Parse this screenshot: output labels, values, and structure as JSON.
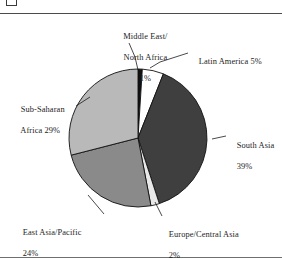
{
  "figure": {
    "corner_glyph": "page-corner-marker",
    "has_top_rule": true,
    "has_bottom_rule": true
  },
  "chart_data": {
    "type": "pie",
    "title": "",
    "subtitle": "",
    "xlabel": "",
    "ylabel": "",
    "legend_position": "callout-labels",
    "grid": false,
    "total": 100,
    "units": "percent",
    "start_angle_deg": -90,
    "direction": "clockwise",
    "categories": [
      "Middle East/\nNorth Africa",
      "Latin America",
      "South Asia",
      "Europe/Central Asia",
      "East Asia/Pacific",
      "Sub-Saharan Africa"
    ],
    "values": [
      1,
      5,
      39,
      2,
      24,
      29
    ],
    "slices": [
      {
        "key": "middle-east-north-africa",
        "name_line1": "Middle East/",
        "name_line2": "North Africa",
        "label": "Middle East/ North Africa",
        "value": 1,
        "value_label": "1%",
        "color": "#111111",
        "stroke": "#111111"
      },
      {
        "key": "latin-america",
        "name_line1": "Latin America 5%",
        "name_line2": "",
        "label": "Latin America",
        "value": 5,
        "value_label": "5%",
        "color": "#ffffff",
        "stroke": "#111111"
      },
      {
        "key": "south-asia",
        "name_line1": "South Asia",
        "name_line2": "",
        "label": "South Asia",
        "value": 39,
        "value_label": "39%",
        "color": "#3f3f3f",
        "stroke": "#111111"
      },
      {
        "key": "europe-central-asia",
        "name_line1": "Europe/Central Asia",
        "name_line2": "",
        "label": "Europe/Central Asia",
        "value": 2,
        "value_label": "2%",
        "color": "#e8e8e8",
        "stroke": "#111111"
      },
      {
        "key": "east-asia-pacific",
        "name_line1": "East Asia/Pacific",
        "name_line2": "",
        "label": "East Asia/Pacific",
        "value": 24,
        "value_label": "24%",
        "color": "#8a8a8a",
        "stroke": "#111111"
      },
      {
        "key": "sub-saharan-africa",
        "name_line1": "Sub-Saharan",
        "name_line2": "Africa 29%",
        "label": "Sub-Saharan Africa",
        "value": 29,
        "value_label": "29%",
        "color": "#b9b9b9",
        "stroke": "#111111"
      }
    ]
  },
  "labels": {
    "middle_east_north_africa": {
      "line1": "Middle East/",
      "line2": "North Africa",
      "line3": "1%"
    },
    "latin_america": {
      "line1": "Latin America 5%"
    },
    "south_asia": {
      "line1": "South Asia",
      "line2": "39%"
    },
    "europe_central_asia": {
      "line1": "Europe/Central Asia",
      "line2": "2%"
    },
    "east_asia_pacific": {
      "line1": "East Asia/Pacific",
      "line2": "24%"
    },
    "sub_saharan_africa": {
      "line1": "Sub-Saharan",
      "line2": "Africa 29%"
    }
  },
  "colors": {
    "page_background": "#ffffff",
    "text": "#1c1c1c",
    "rule": "#4a4a4a",
    "outline": "#111111"
  }
}
